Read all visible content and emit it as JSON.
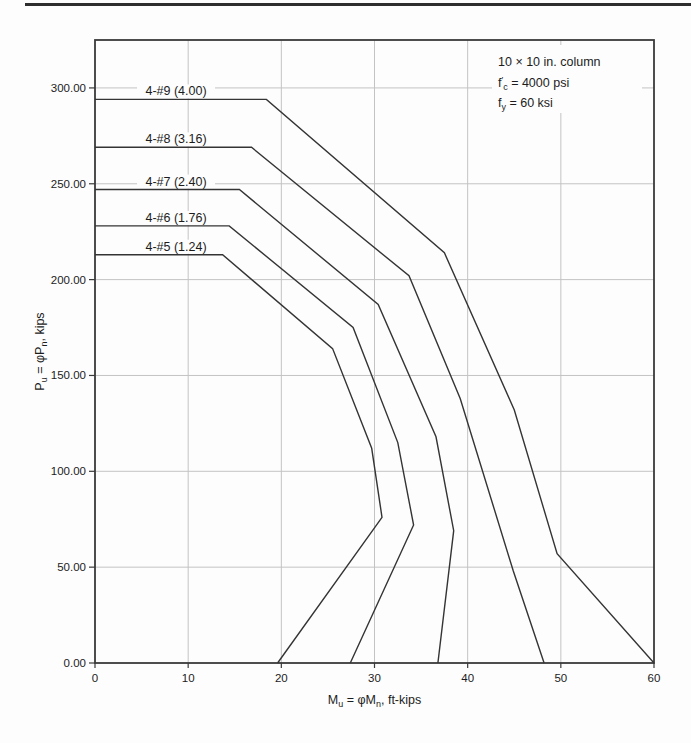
{
  "chart_data": {
    "type": "line",
    "title": "",
    "xlabel_parts": [
      {
        "t": "M"
      },
      {
        "t": "u",
        "sub": true
      },
      {
        "t": " = "
      },
      {
        "t": "φ"
      },
      {
        "t": "M"
      },
      {
        "t": "n",
        "sub": true
      },
      {
        "t": ", ft-kips"
      }
    ],
    "ylabel_parts": [
      {
        "t": "P"
      },
      {
        "t": "u",
        "sub": true
      },
      {
        "t": " = "
      },
      {
        "t": "φ"
      },
      {
        "t": "P"
      },
      {
        "t": "n",
        "sub": true
      },
      {
        "t": ", kips"
      }
    ],
    "xlim": [
      0,
      60
    ],
    "ylim": [
      0,
      325
    ],
    "grid": true,
    "legend_position": "inline-labels",
    "x_ticks": [
      {
        "v": 0,
        "label": "0"
      },
      {
        "v": 10,
        "label": "10"
      },
      {
        "v": 20,
        "label": "20"
      },
      {
        "v": 30,
        "label": "30"
      },
      {
        "v": 40,
        "label": "40"
      },
      {
        "v": 50,
        "label": "50"
      },
      {
        "v": 60,
        "label": "60"
      }
    ],
    "y_ticks": [
      {
        "v": 0,
        "label": "0.00"
      },
      {
        "v": 50,
        "label": "50.00"
      },
      {
        "v": 100,
        "label": "100.00"
      },
      {
        "v": 150,
        "label": "150.00"
      },
      {
        "v": 200,
        "label": "200.00"
      },
      {
        "v": 250,
        "label": "250.00"
      },
      {
        "v": 300,
        "label": "300.00"
      }
    ],
    "annotation": {
      "lines": [
        [
          {
            "t": "10 × 10 in. column"
          }
        ],
        [
          {
            "t": "f"
          },
          {
            "t": "′",
            "sup": true
          },
          {
            "t": "c",
            "sub": true
          },
          {
            "t": " = 4000 psi"
          }
        ],
        [
          {
            "t": "f"
          },
          {
            "t": "y",
            "sub": true
          },
          {
            "t": " = 60 ksi"
          }
        ]
      ]
    },
    "series": [
      {
        "bars": "4-#9",
        "steel_area_in2": "4.00",
        "label": "4-#9 (4.00)",
        "points": [
          [
            0,
            294
          ],
          [
            18.4,
            294
          ],
          [
            37.5,
            214
          ],
          [
            45.0,
            132
          ],
          [
            49.6,
            57
          ],
          [
            60.0,
            0
          ]
        ]
      },
      {
        "bars": "4-#8",
        "steel_area_in2": "3.16",
        "label": "4-#8 (3.16)",
        "points": [
          [
            0,
            269
          ],
          [
            16.8,
            269
          ],
          [
            33.7,
            202
          ],
          [
            39.2,
            138
          ],
          [
            44.9,
            48
          ],
          [
            48.2,
            0
          ]
        ]
      },
      {
        "bars": "4-#7",
        "steel_area_in2": "2.40",
        "label": "4-#7 (2.40)",
        "points": [
          [
            0,
            247
          ],
          [
            15.5,
            247
          ],
          [
            30.4,
            187
          ],
          [
            36.6,
            118
          ],
          [
            38.5,
            69
          ],
          [
            36.8,
            0
          ]
        ]
      },
      {
        "bars": "4-#6",
        "steel_area_in2": "1.76",
        "label": "4-#6 (1.76)",
        "points": [
          [
            0,
            228
          ],
          [
            14.4,
            228
          ],
          [
            27.7,
            175
          ],
          [
            32.5,
            115
          ],
          [
            34.2,
            72
          ],
          [
            27.4,
            0
          ]
        ]
      },
      {
        "bars": "4-#5",
        "steel_area_in2": "1.24",
        "label": "4-#5 (1.24)",
        "points": [
          [
            0,
            213
          ],
          [
            13.7,
            213
          ],
          [
            25.5,
            164
          ],
          [
            29.7,
            112
          ],
          [
            30.8,
            76
          ],
          [
            19.6,
            0
          ]
        ]
      }
    ],
    "colors": {
      "curve": "#343434",
      "grid": "#c3c3c3",
      "frame": "#3a3a3a",
      "text": "#1c1c1c",
      "background": "#fdfdfd"
    }
  }
}
